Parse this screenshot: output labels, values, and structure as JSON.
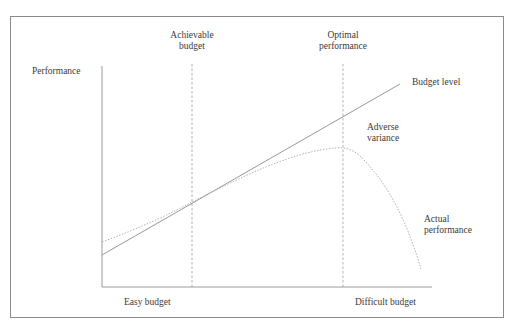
{
  "diagram": {
    "axes": {
      "y_label": "Performance",
      "x_label_left": "Easy budget",
      "x_label_right": "Difficult budget"
    },
    "markers": [
      {
        "line1": "Achievable",
        "line2": "budget"
      },
      {
        "line1": "Optimal",
        "line2": "performance"
      }
    ],
    "series_labels": {
      "budget_level": "Budget level",
      "adverse_variance_line1": "Adverse",
      "adverse_variance_line2": "variance",
      "actual_line1": "Actual",
      "actual_line2": "performance"
    },
    "colors": {
      "axis": "#9a9a9a",
      "budget_line": "#8c8c8c",
      "actual_curve": "#a8a8a8",
      "marker_lines": "#a0a0a0",
      "frame": "#8a8a8a",
      "text": "#3a3a3a"
    }
  }
}
